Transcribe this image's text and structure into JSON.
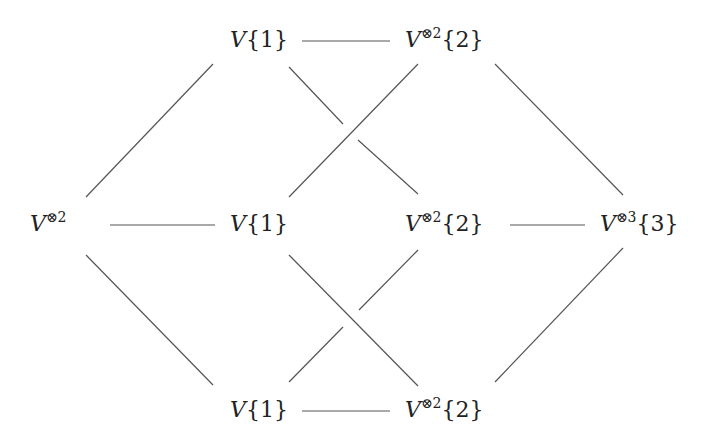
{
  "diagram": {
    "type": "commutative-diagram",
    "line_color": "#555555",
    "nodes": [
      {
        "id": "left",
        "base": "V",
        "sup": "⊗2",
        "idx": "",
        "x": 30,
        "y": 213
      },
      {
        "id": "top1",
        "base": "V",
        "sup": "",
        "idx": "{1}",
        "x": 230,
        "y": 29
      },
      {
        "id": "top2",
        "base": "V",
        "sup": "⊗2",
        "idx": "{2}",
        "x": 405,
        "y": 29
      },
      {
        "id": "mid1",
        "base": "V",
        "sup": "",
        "idx": "{1}",
        "x": 230,
        "y": 213
      },
      {
        "id": "mid2",
        "base": "V",
        "sup": "⊗2",
        "idx": "{2}",
        "x": 405,
        "y": 213
      },
      {
        "id": "right",
        "base": "V",
        "sup": "⊗3",
        "idx": "{3}",
        "x": 600,
        "y": 213
      },
      {
        "id": "bot1",
        "base": "V",
        "sup": "",
        "idx": "{1}",
        "x": 230,
        "y": 399
      },
      {
        "id": "bot2",
        "base": "V",
        "sup": "⊗2",
        "idx": "{2}",
        "x": 405,
        "y": 399
      }
    ],
    "edges": [
      {
        "from": "left",
        "to": "top1"
      },
      {
        "from": "left",
        "to": "mid1"
      },
      {
        "from": "left",
        "to": "bot1"
      },
      {
        "from": "top1",
        "to": "top2"
      },
      {
        "from": "top1",
        "to": "mid2",
        "crossing": "under"
      },
      {
        "from": "top2",
        "to": "mid1",
        "crossing": "over"
      },
      {
        "from": "top2",
        "to": "right"
      },
      {
        "from": "mid2",
        "to": "right"
      },
      {
        "from": "mid1",
        "to": "bot2",
        "crossing": "over"
      },
      {
        "from": "bot1",
        "to": "mid2",
        "crossing": "under"
      },
      {
        "from": "bot1",
        "to": "bot2"
      },
      {
        "from": "bot2",
        "to": "right"
      }
    ]
  }
}
